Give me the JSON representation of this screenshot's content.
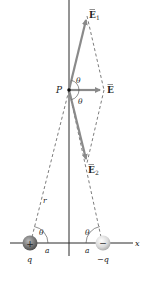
{
  "figure": {
    "point": {
      "label": "P",
      "x": 69,
      "y": 90
    },
    "axes": {
      "x_label": "x",
      "y_axis_x": 69,
      "x_axis_y": 243
    },
    "vectors": [
      {
        "name": "E1",
        "label": "E",
        "subscript": "1",
        "tip": [
          87,
          16
        ]
      },
      {
        "name": "E",
        "label": "E",
        "subscript": "",
        "tip": [
          104,
          90
        ]
      },
      {
        "name": "E2",
        "label": "E",
        "subscript": "2",
        "tip": [
          87,
          163
        ]
      }
    ],
    "charges": [
      {
        "name": "positive-charge",
        "sign": "+",
        "label": "q",
        "cx": 30,
        "cy": 243
      },
      {
        "name": "negative-charge",
        "sign": "−",
        "label": "−q",
        "cx": 103,
        "cy": 243
      }
    ],
    "labels": {
      "theta": "θ",
      "a": "a",
      "r": "r",
      "x": "x",
      "p": "P",
      "e_symbol": "E",
      "e1_sub": "1",
      "e2_sub": "2",
      "q_pos": "q",
      "q_neg": "−q",
      "plus": "+",
      "minus": "−"
    },
    "colors": {
      "axis": "#2a2a2a",
      "vector": "#8a8a8a",
      "dashed": "#444444",
      "text": "#222222",
      "pos_charge": "#7a7a7a",
      "neg_charge": "#d8d8d8"
    }
  }
}
